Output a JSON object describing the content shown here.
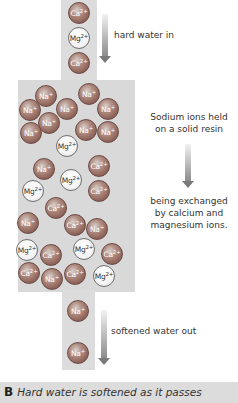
{
  "figure": {
    "labels": {
      "hard_water_in": "hard water in",
      "resin_note_1": "Sodium ions held",
      "resin_note_2": "on a solid resin",
      "exchange_note_1": "being exchanged",
      "exchange_note_2": "by calcium and",
      "exchange_note_3": "magnesium ions.",
      "softened_out": "softened water out"
    },
    "caption": {
      "letter": "B",
      "text": "Hard water is softened as it passes"
    },
    "ions": {
      "inflow": [
        {
          "symbol": "Ca",
          "charge": "2+",
          "type": "dark"
        },
        {
          "symbol": "Mg",
          "charge": "2+",
          "type": "light"
        },
        {
          "symbol": "Ca",
          "charge": "2+",
          "type": "dark"
        }
      ],
      "resin": [
        {
          "symbol": "Na",
          "charge": "+",
          "type": "dark",
          "x": 35,
          "y": 85
        },
        {
          "symbol": "Na",
          "charge": "+",
          "type": "dark",
          "x": 78,
          "y": 83
        },
        {
          "symbol": "Na",
          "charge": "+",
          "type": "dark",
          "x": 19,
          "y": 99
        },
        {
          "symbol": "Na",
          "charge": "+",
          "type": "dark",
          "x": 56,
          "y": 98
        },
        {
          "symbol": "Na",
          "charge": "+",
          "type": "dark",
          "x": 97,
          "y": 98
        },
        {
          "symbol": "Na",
          "charge": "+",
          "type": "dark",
          "x": 38,
          "y": 112
        },
        {
          "symbol": "Na",
          "charge": "+",
          "type": "dark",
          "x": 20,
          "y": 122
        },
        {
          "symbol": "Na",
          "charge": "+",
          "type": "dark",
          "x": 75,
          "y": 119
        },
        {
          "symbol": "Na",
          "charge": "+",
          "type": "dark",
          "x": 97,
          "y": 121
        },
        {
          "symbol": "Mg",
          "charge": "2+",
          "type": "light",
          "x": 56,
          "y": 135
        },
        {
          "symbol": "Na",
          "charge": "+",
          "type": "dark",
          "x": 33,
          "y": 158
        },
        {
          "symbol": "Ca",
          "charge": "2+",
          "type": "dark",
          "x": 88,
          "y": 155
        },
        {
          "symbol": "Mg",
          "charge": "2+",
          "type": "light",
          "x": 60,
          "y": 169
        },
        {
          "symbol": "Mg",
          "charge": "2+",
          "type": "light",
          "x": 22,
          "y": 180
        },
        {
          "symbol": "Ca",
          "charge": "2+",
          "type": "dark",
          "x": 88,
          "y": 180
        },
        {
          "symbol": "Ca",
          "charge": "2+",
          "type": "dark",
          "x": 45,
          "y": 197
        },
        {
          "symbol": "Na",
          "charge": "+",
          "type": "dark",
          "x": 17,
          "y": 212
        },
        {
          "symbol": "Ca",
          "charge": "2+",
          "type": "dark",
          "x": 64,
          "y": 214
        },
        {
          "symbol": "Na",
          "charge": "+",
          "type": "dark",
          "x": 86,
          "y": 218
        },
        {
          "symbol": "Mg",
          "charge": "2+",
          "type": "light",
          "x": 16,
          "y": 239
        },
        {
          "symbol": "Ca",
          "charge": "2+",
          "type": "dark",
          "x": 40,
          "y": 244
        },
        {
          "symbol": "Mg",
          "charge": "2+",
          "type": "light",
          "x": 73,
          "y": 238
        },
        {
          "symbol": "Ca",
          "charge": "2+",
          "type": "dark",
          "x": 101,
          "y": 243
        },
        {
          "symbol": "Ca",
          "charge": "2+",
          "type": "dark",
          "x": 18,
          "y": 262
        },
        {
          "symbol": "Na",
          "charge": "+",
          "type": "dark",
          "x": 41,
          "y": 268
        },
        {
          "symbol": "Ca",
          "charge": "2+",
          "type": "dark",
          "x": 64,
          "y": 263
        },
        {
          "symbol": "Mg",
          "charge": "2+",
          "type": "light",
          "x": 93,
          "y": 265
        }
      ],
      "outflow": [
        {
          "symbol": "Na",
          "charge": "+",
          "type": "dark"
        },
        {
          "symbol": "Na",
          "charge": "+",
          "type": "dark"
        }
      ]
    }
  }
}
